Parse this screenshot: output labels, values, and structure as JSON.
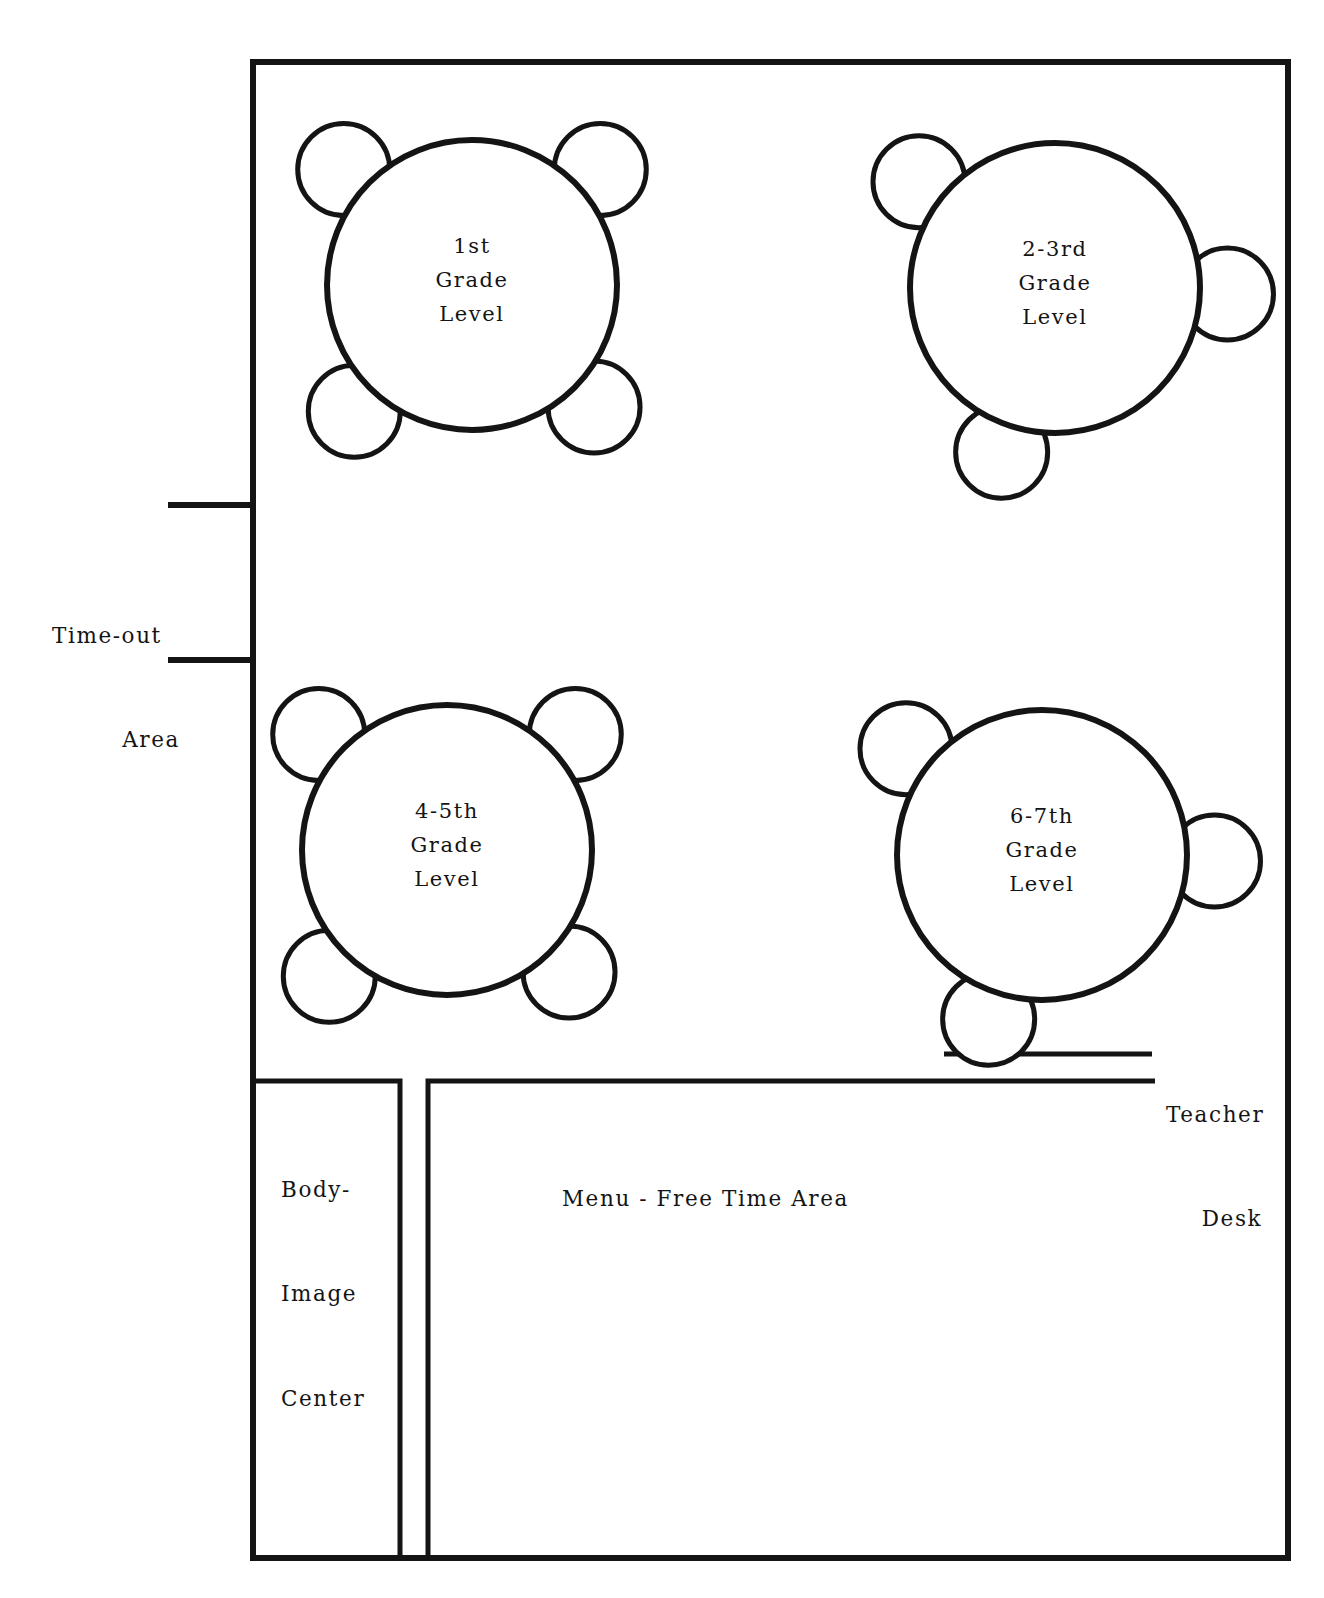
{
  "diagram": {
    "kind": "classroom-floor-plan",
    "line_color": "#141414",
    "background_color": "#ffffff",
    "room": {
      "name": "classroom-outline",
      "x": 253,
      "y": 62,
      "width": 1035,
      "height": 1496,
      "stroke_width": 6
    }
  },
  "tables": [
    {
      "id": "table-1st-grade",
      "cx": 472,
      "cy": 285,
      "r": 145,
      "chair_r": 46,
      "chair_angles_deg": [
        222,
        318,
        45,
        133
      ],
      "label_lines": [
        "1st",
        "Grade",
        "Level"
      ]
    },
    {
      "id": "table-2-3rd-grade",
      "cx": 1055,
      "cy": 288,
      "r": 145,
      "chair_r": 46,
      "chair_angles_deg": [
        218,
        2,
        108
      ],
      "label_lines": [
        "2-3rd",
        "Grade",
        "Level"
      ]
    },
    {
      "id": "table-4-5th-grade",
      "cx": 447,
      "cy": 850,
      "r": 145,
      "chair_r": 46,
      "chair_angles_deg": [
        222,
        318,
        45,
        133
      ],
      "label_lines": [
        "4-5th",
        "Grade",
        "Level"
      ]
    },
    {
      "id": "table-6-7th-grade",
      "cx": 1042,
      "cy": 855,
      "r": 145,
      "chair_r": 46,
      "chair_angles_deg": [
        218,
        2,
        108
      ],
      "label_lines": [
        "6-7th",
        "Grade",
        "Level"
      ]
    }
  ],
  "areas": {
    "timeout": {
      "label_lines": [
        "Time-out",
        "Area"
      ],
      "wall_stubs": [
        {
          "x1": 168,
          "y1": 505,
          "x2": 256,
          "y2": 505
        },
        {
          "x1": 168,
          "y1": 660,
          "x2": 256,
          "y2": 660
        }
      ]
    },
    "teacher_desk": {
      "label_lines": [
        "Teacher",
        "Desk"
      ],
      "desk_line": {
        "x1": 944,
        "y1": 1054,
        "x2": 1152,
        "y2": 1054
      }
    },
    "body_image_center": {
      "label_lines": [
        "Body-",
        "Image",
        "Center"
      ],
      "rect": {
        "x": 256,
        "y": 1081,
        "width": 144,
        "height": 477
      }
    },
    "menu_free_time": {
      "label_lines": [
        "Menu - Free Time Area"
      ],
      "rect": {
        "x": 428,
        "y": 1081,
        "width": 727,
        "height": 477
      }
    }
  }
}
